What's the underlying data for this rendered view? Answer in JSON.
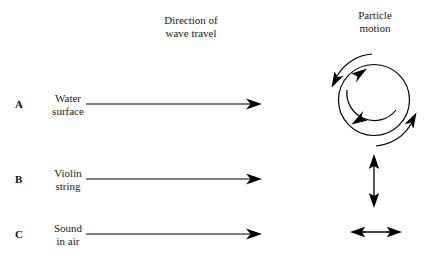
{
  "figure": {
    "title_columns": {
      "direction_of_wave_travel": "Direction of\nwave travel",
      "particle_motion": "Particle\nmotion"
    },
    "background_color": "#ffffff",
    "stroke_color": "#000000"
  },
  "rows": [
    {
      "letter": "A",
      "label": "Water\nsurface",
      "travel_arrow": "single-headed-arrow-right",
      "particle_motion_icon": "circular-motion-arrows",
      "particle_motion_description": "circle with clockwise curved arrows"
    },
    {
      "letter": "B",
      "label": "Violin\nstring",
      "travel_arrow": "single-headed-arrow-right",
      "particle_motion_icon": "vertical-double-arrow",
      "particle_motion_description": "transverse up-down double arrow"
    },
    {
      "letter": "C",
      "label": "Sound\nin air",
      "travel_arrow": "single-headed-arrow-right",
      "particle_motion_icon": "horizontal-double-arrow",
      "particle_motion_description": "longitudinal left-right double arrow"
    }
  ]
}
